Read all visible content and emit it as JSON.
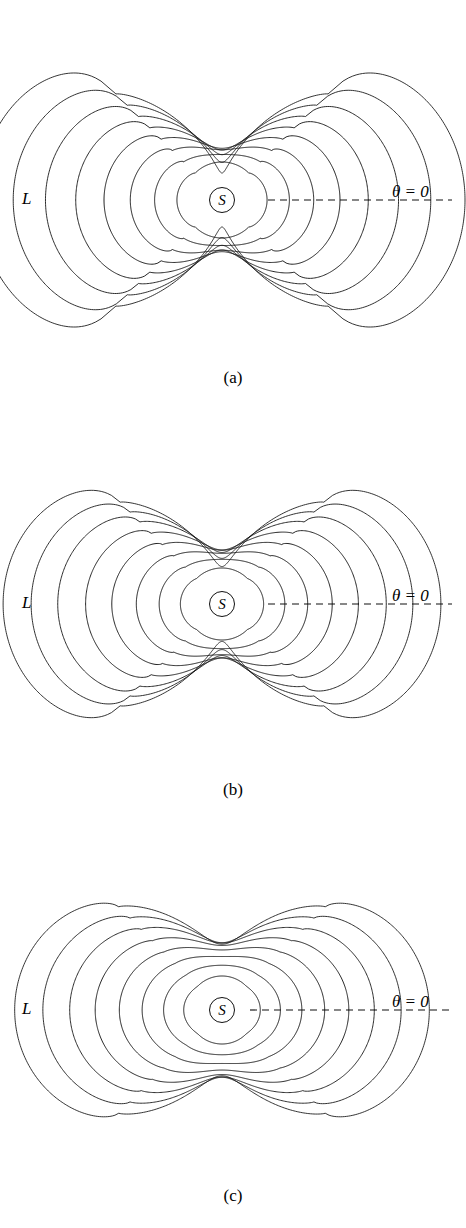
{
  "figure": {
    "kind": "contour-figure",
    "background_color": "#ffffff",
    "line_color": "#111111",
    "width": 466,
    "height": 1228,
    "panel_count": 3
  },
  "panels": [
    {
      "caption": "(a)",
      "label_L": "L",
      "label_S": "S",
      "label_theta": "θ = 0",
      "caption_top": 368,
      "plot_top": 0,
      "center_x": 222,
      "center_y": 200,
      "label_L_left": 22,
      "label_L_top": 190,
      "label_S_left": 209,
      "label_S_top": 187,
      "label_theta_left": 392,
      "label_theta_top": 183,
      "axis_x1": 268,
      "axis_x2": 452,
      "axis_y": 200,
      "contour_count": 8
    },
    {
      "caption": "(b)",
      "label_L": "L",
      "label_S": "S",
      "label_theta": "θ = 0",
      "caption_top": 780,
      "plot_top": 410,
      "center_x": 222,
      "center_y": 604,
      "label_L_left": 22,
      "label_L_top": 594,
      "label_S_left": 209,
      "label_S_top": 591,
      "label_theta_left": 392,
      "label_theta_top": 587,
      "axis_x1": 268,
      "axis_x2": 452,
      "axis_y": 604,
      "contour_count": 8
    },
    {
      "caption": "(c)",
      "label_L": "L",
      "label_S": "S",
      "label_theta": "θ = 0",
      "caption_top": 1186,
      "plot_top": 815,
      "center_x": 222,
      "center_y": 1010,
      "label_L_left": 22,
      "label_L_top": 1000,
      "label_S_left": 209,
      "label_S_top": 997,
      "label_theta_left": 392,
      "label_theta_top": 993,
      "axis_x1": 250,
      "axis_x2": 452,
      "axis_y": 1010,
      "contour_count": 8
    }
  ],
  "chart_data": {
    "type": "line",
    "title": "",
    "xlabel": "",
    "ylabel": "",
    "panels": [
      {
        "name": "(a)",
        "symmetry_order": 4,
        "contour_levels": [
          1,
          2,
          3,
          4,
          5,
          6,
          7,
          8
        ],
        "lobe_amplitude": 0.62,
        "lobe_sharpness": 2.6,
        "waist_pinch": 0.82,
        "base_radii": [
          38,
          54,
          70,
          86,
          102,
          118,
          134,
          150
        ],
        "lobe_shape": "broad flat-topped lobes with sharp pinched waists (saddle necks) at 45 degrees",
        "notes": "outermost contours nearly square-topped; necks collapse to near-cusps"
      },
      {
        "name": "(b)",
        "symmetry_order": 4,
        "contour_levels": [
          1,
          2,
          3,
          4,
          5,
          6,
          7,
          8
        ],
        "lobe_amplitude": 0.52,
        "lobe_sharpness": 2.1,
        "waist_pinch": 0.74,
        "base_radii": [
          36,
          52,
          68,
          84,
          100,
          116,
          130,
          144
        ],
        "lobe_shape": "rounded bulbous lobes, waists pinched but less extreme than (a)",
        "notes": "intermediate case between (a) and (c)"
      },
      {
        "name": "(c)",
        "symmetry_order": 4,
        "contour_levels": [
          1,
          2,
          3,
          4,
          5,
          6,
          7,
          8
        ],
        "lobe_amplitude": 0.42,
        "lobe_sharpness": 1.5,
        "waist_pinch": 0.55,
        "base_radii": [
          34,
          50,
          66,
          82,
          98,
          114,
          130,
          146
        ],
        "lobe_shape": "smooth four-pointed star / astroid-like contours, evenly nested",
        "notes": "no strong saddle necks; contours remain smooth and concentric"
      }
    ],
    "axis_annotation": "θ = 0",
    "centre_marker": "S",
    "left_marker": "L",
    "legend": [],
    "grid": false
  }
}
